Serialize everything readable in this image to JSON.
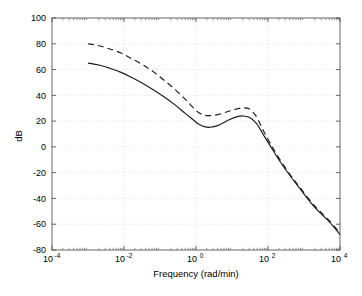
{
  "chart_data": {
    "type": "line",
    "title": "",
    "xlabel": "Frequency (rad/min)",
    "ylabel": "dB",
    "xscale": "log",
    "xlim": [
      0.0001,
      10000
    ],
    "ylim": [
      -80,
      100
    ],
    "grid": true,
    "legend": "none",
    "xtick_labels": [
      "10",
      "10",
      "10",
      "10",
      "10"
    ],
    "xtick_exponents": [
      "-4",
      "-2",
      "0",
      "2",
      "4"
    ],
    "xtick_values": [
      0.0001,
      0.01,
      1,
      100,
      10000
    ],
    "ytick_labels": [
      "100",
      "80",
      "60",
      "40",
      "20",
      "0",
      "-20",
      "-40",
      "-60",
      "-80"
    ],
    "ytick_values": [
      100,
      80,
      60,
      40,
      20,
      0,
      -20,
      -40,
      -60,
      -80
    ],
    "series": [
      {
        "name": "solid-curve",
        "style": "solid",
        "color": "#1a1a1a",
        "x": [
          0.001,
          0.002,
          0.004,
          0.008,
          0.015,
          0.03,
          0.06,
          0.12,
          0.25,
          0.5,
          0.8,
          1.2,
          1.8,
          2.5,
          4,
          6,
          9,
          14,
          20,
          30,
          45,
          60,
          80,
          120,
          200,
          400,
          800,
          2000,
          5000,
          10000
        ],
        "y": [
          65,
          63.5,
          61,
          58,
          54.5,
          50,
          45,
          39.5,
          33,
          26,
          21.5,
          17.5,
          15.5,
          15.2,
          16.5,
          19,
          21.5,
          23.5,
          24,
          23,
          19,
          14,
          8,
          0,
          -10,
          -22,
          -33,
          -47,
          -58,
          -68
        ]
      },
      {
        "name": "dashed-curve",
        "style": "dashed",
        "color": "#1a1a1a",
        "x": [
          0.001,
          0.002,
          0.004,
          0.008,
          0.015,
          0.03,
          0.06,
          0.12,
          0.25,
          0.5,
          0.8,
          1.2,
          1.8,
          2.5,
          4,
          6,
          9,
          14,
          20,
          30,
          45,
          60,
          80,
          120,
          200,
          400,
          800,
          2000,
          5000,
          10000
        ],
        "y": [
          80,
          78.5,
          76,
          73,
          69,
          64.5,
          59,
          52.5,
          45,
          37,
          31,
          26.5,
          24.5,
          24.3,
          25,
          26.5,
          28,
          29.5,
          30.3,
          29.5,
          24.5,
          18,
          11,
          2,
          -8.5,
          -21,
          -32,
          -46,
          -57,
          -67
        ]
      }
    ]
  },
  "figure": {
    "background_color": "#ffffff",
    "axes_color": "#555555",
    "grid_color": "#d8d8d8",
    "line_color": "#1a1a1a"
  }
}
